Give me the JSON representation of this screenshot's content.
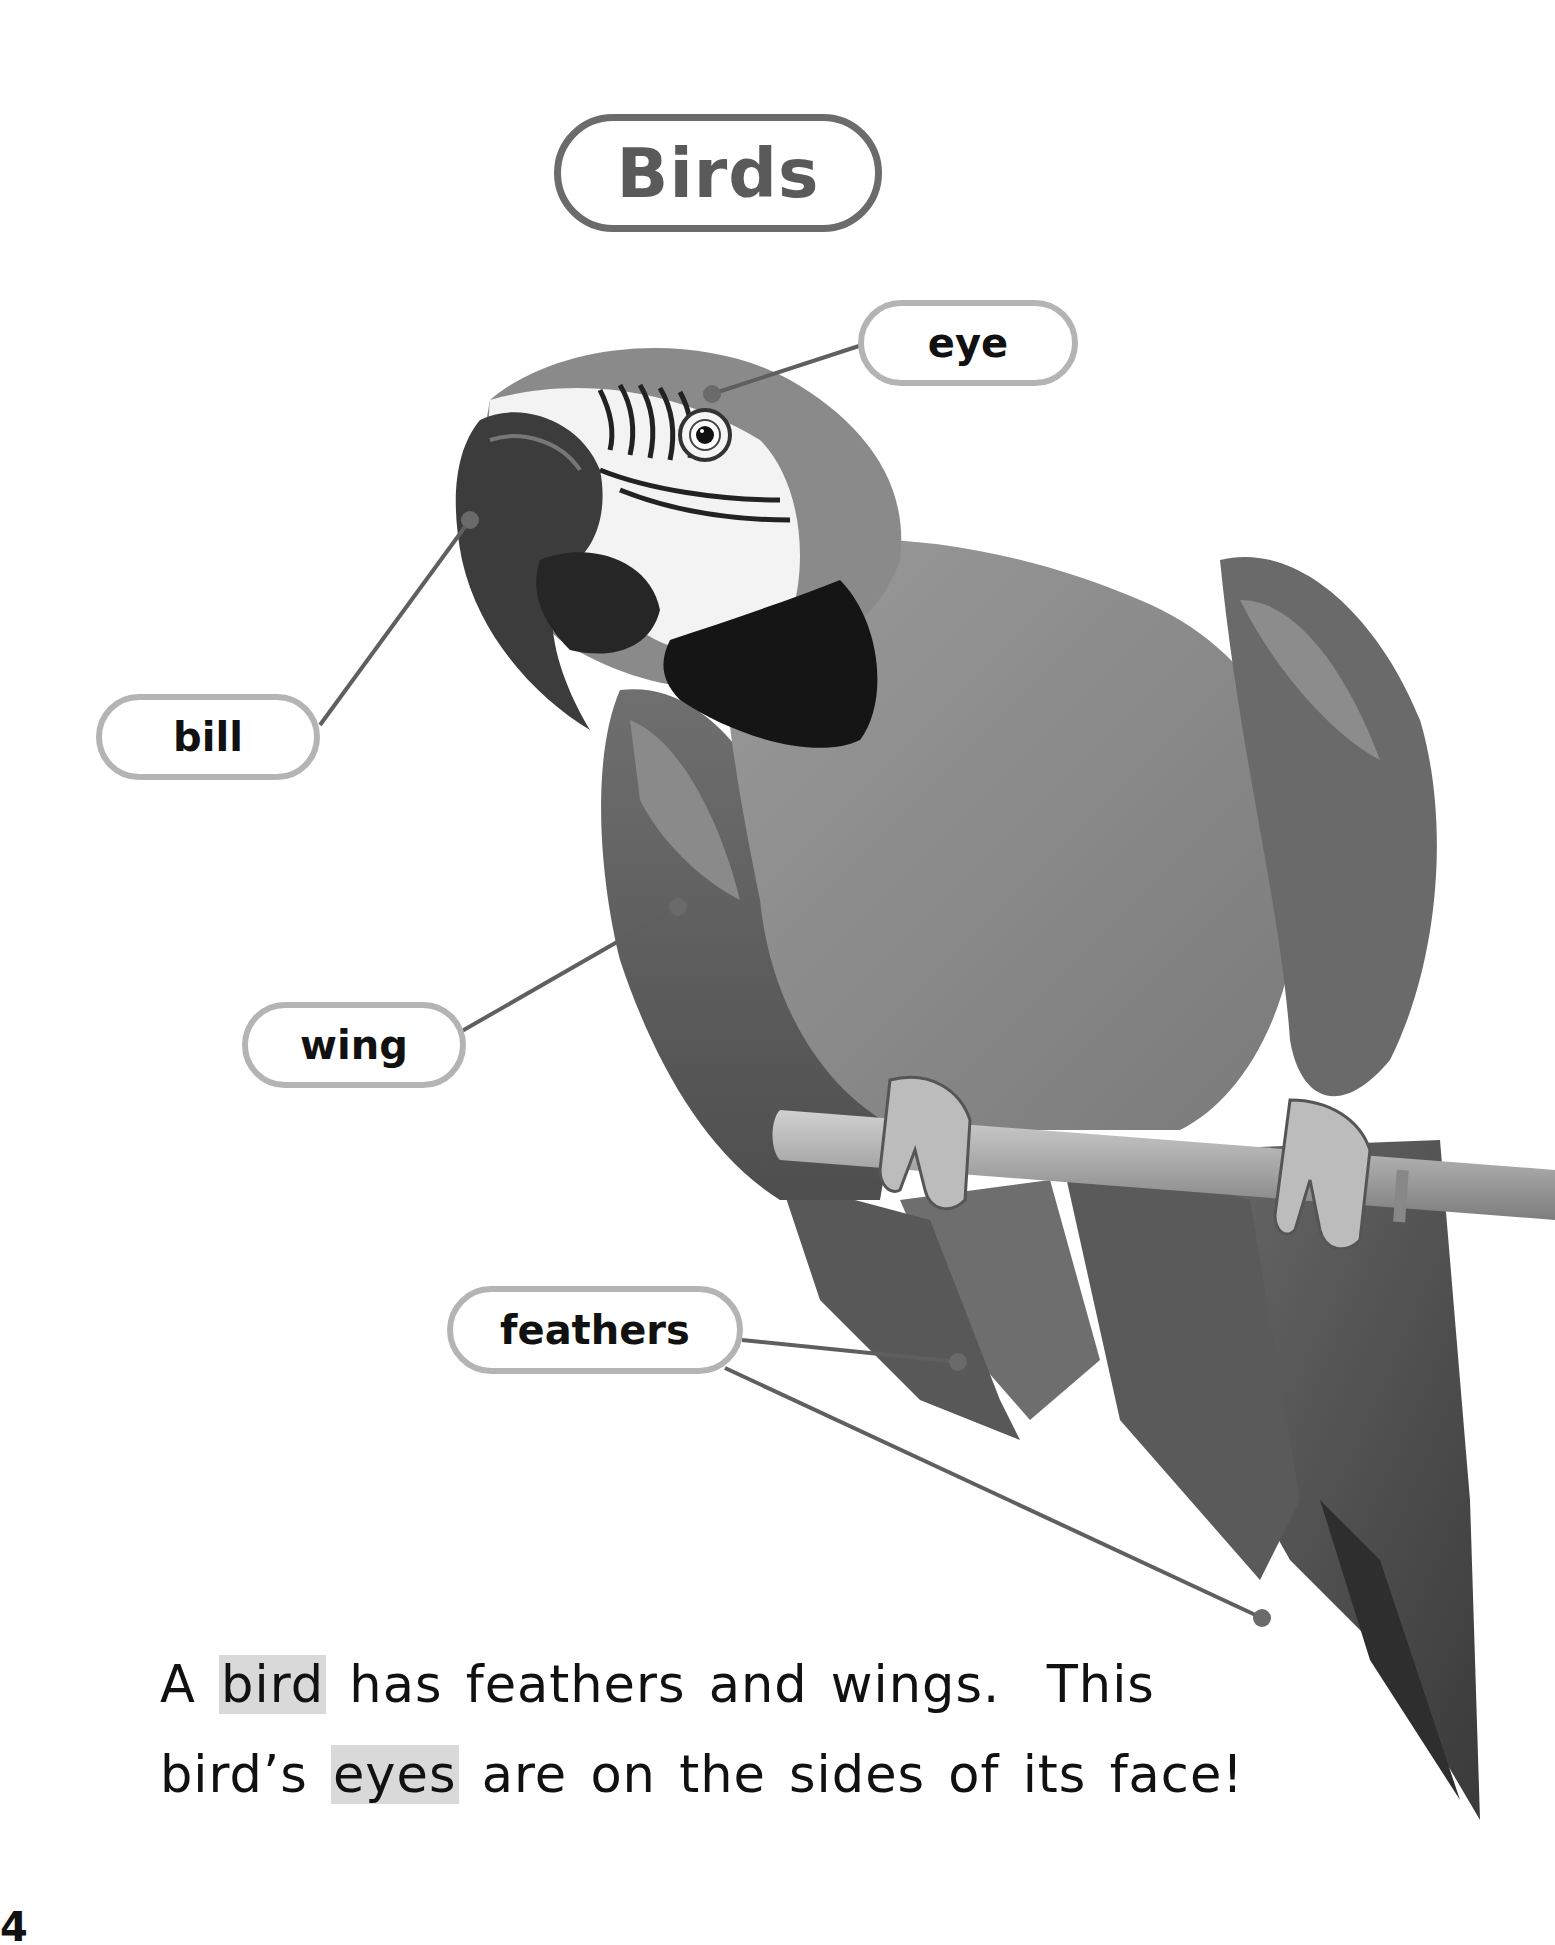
{
  "page": {
    "title": "Birds",
    "page_number_fragment": "4"
  },
  "labels": {
    "eye": "eye",
    "bill": "bill",
    "wing": "wing",
    "feathers": "feathers"
  },
  "body_text": {
    "line1_before": "A ",
    "line1_highlight": "bird",
    "line1_after": " has feathers and wings.  This",
    "line2_before": "bird’s ",
    "line2_highlight": "eyes",
    "line2_after": " are on the sides of its face!"
  },
  "image": {
    "subject": "macaw parrot perched on a branch",
    "icon": "parrot-photo"
  },
  "colors": {
    "pill_border": "#b4b4b4",
    "title_border": "#6b6b6b",
    "leader_line": "#5f5f5f",
    "highlight": "#d9d9d9"
  }
}
